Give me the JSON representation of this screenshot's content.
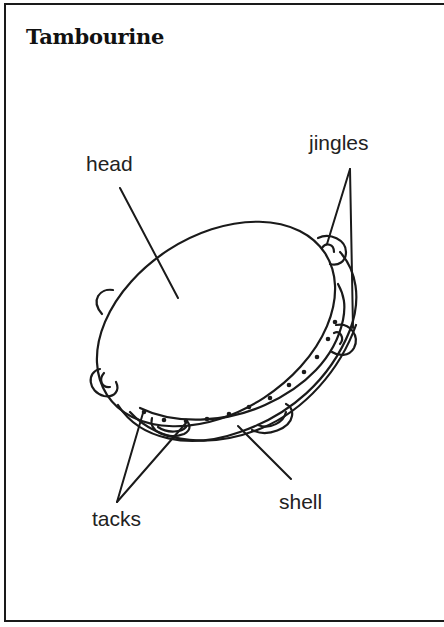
{
  "title": "Tambourine",
  "diagram": {
    "subject": "tambourine",
    "labels": {
      "head": "head",
      "jingles": "jingles",
      "tacks": "tacks",
      "shell": "shell"
    }
  },
  "colors": {
    "ink": "#1a1a1a",
    "background": "#ffffff"
  }
}
